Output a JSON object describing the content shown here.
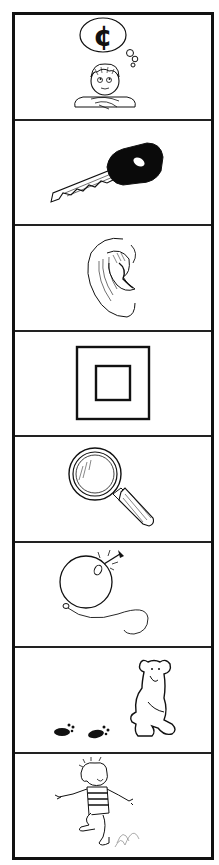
{
  "strip": {
    "panels": [
      {
        "label": "boy thinking of cent",
        "icon": "thinking-boy-cent-icon",
        "symbol": "¢"
      },
      {
        "label": "key",
        "icon": "key-icon"
      },
      {
        "label": "ear",
        "icon": "ear-icon"
      },
      {
        "label": "square inside square",
        "icon": "nested-square-icon"
      },
      {
        "label": "magnifying glass",
        "icon": "magnifying-glass-icon"
      },
      {
        "label": "balloon with pin",
        "icon": "balloon-pin-icon"
      },
      {
        "label": "bear with footprints",
        "icon": "bear-footprints-icon"
      },
      {
        "label": "girl jumping",
        "icon": "jumping-girl-icon"
      }
    ]
  },
  "colors": {
    "ink": "#111111",
    "background": "#ffffff"
  }
}
